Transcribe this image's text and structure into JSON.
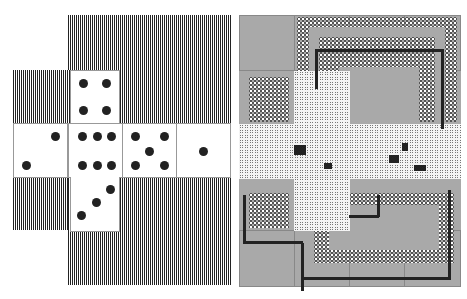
{
  "figure": {
    "left_panel": {
      "description": "Cube net of a die with six faces over concentric square-ring striped background",
      "faces": [
        {
          "name": "top",
          "pips": 4
        },
        {
          "name": "left",
          "pips": 2
        },
        {
          "name": "front",
          "pips": 6
        },
        {
          "name": "right",
          "pips": 5
        },
        {
          "name": "back",
          "pips": 1
        },
        {
          "name": "bottom",
          "pips": 3
        }
      ]
    },
    "right_panel": {
      "description": "Same cube net rendered as a grid of gray cells with dotted-circle rings, noisy central cross and black traced paths"
    },
    "colors": {
      "dark": "#222222",
      "gray": "#a9a9a9",
      "white": "#ffffff"
    }
  }
}
